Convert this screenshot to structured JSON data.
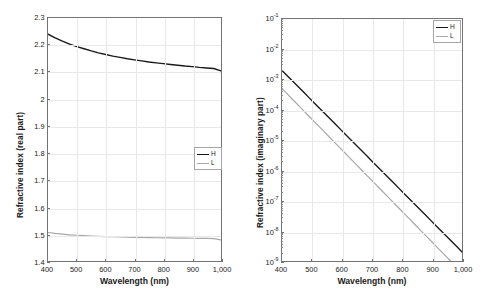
{
  "figure": {
    "panel_count": 2
  },
  "chart_data": [
    {
      "type": "line",
      "panel": "left",
      "title": "",
      "xlabel": "Wavelength (nm)",
      "ylabel": "Refractive index (real part)",
      "xscale": "linear",
      "yscale": "linear",
      "xlim": [
        400,
        1000
      ],
      "ylim": [
        1.4,
        2.3
      ],
      "grid": true,
      "legend_position": "center-right",
      "xticks": [
        400,
        500,
        600,
        700,
        800,
        900,
        1000
      ],
      "xticklabels": [
        "400",
        "500",
        "600",
        "700",
        "800",
        "900",
        "1,000"
      ],
      "yticks": [
        1.4,
        1.5,
        1.6,
        1.7,
        1.8,
        1.9,
        2.0,
        2.1,
        2.2,
        2.3
      ],
      "yticklabels": [
        "1.4",
        "1.5",
        "1.6",
        "1.7",
        "1.8",
        "1.9",
        "2",
        "2.1",
        "2.2",
        "2.3"
      ],
      "x": [
        400,
        425,
        450,
        475,
        500,
        525,
        550,
        575,
        600,
        625,
        650,
        675,
        700,
        725,
        750,
        775,
        800,
        825,
        850,
        875,
        900,
        925,
        950,
        975,
        1000
      ],
      "series": [
        {
          "name": "H",
          "color": "#1a1a1a",
          "width": 1.4,
          "values": [
            2.24,
            2.226,
            2.214,
            2.203,
            2.194,
            2.186,
            2.178,
            2.171,
            2.165,
            2.159,
            2.154,
            2.149,
            2.145,
            2.141,
            2.137,
            2.134,
            2.131,
            2.128,
            2.125,
            2.122,
            2.12,
            2.117,
            2.115,
            2.113,
            2.104
          ]
        },
        {
          "name": "L",
          "color": "#a8a8a8",
          "width": 1.2,
          "values": [
            1.5055,
            1.502,
            1.4993,
            1.4971,
            1.4953,
            1.4938,
            1.4925,
            1.4915,
            1.4905,
            1.4897,
            1.489,
            1.4883,
            1.4877,
            1.4872,
            1.4867,
            1.4862,
            1.4858,
            1.4854,
            1.485,
            1.4846,
            1.4842,
            1.4838,
            1.4835,
            1.4831,
            1.4782
          ]
        }
      ]
    },
    {
      "type": "line",
      "panel": "right",
      "title": "",
      "xlabel": "Wavelength (nm)",
      "ylabel": "Refractive index (imaginary part)",
      "xscale": "linear",
      "yscale": "log",
      "xlim": [
        400,
        1000
      ],
      "ylim": [
        1e-09,
        0.1
      ],
      "grid": true,
      "legend_position": "upper-right",
      "xticks": [
        400,
        500,
        600,
        700,
        800,
        900,
        1000
      ],
      "xticklabels": [
        "400",
        "500",
        "600",
        "700",
        "800",
        "900",
        "1,000"
      ],
      "yticks": [
        1e-09,
        1e-08,
        1e-07,
        1e-06,
        1e-05,
        0.0001,
        0.001,
        0.01,
        0.1
      ],
      "yticklabels": [
        "10-9",
        "10-8",
        "10-7",
        "10-6",
        "10-5",
        "10-4",
        "10-3",
        "10-2",
        "10-1"
      ],
      "yticklabel_base": "10",
      "yticklabel_exponents": [
        "-9",
        "-8",
        "-7",
        "-6",
        "-5",
        "-4",
        "-3",
        "-2",
        "-1"
      ],
      "x": [
        400,
        1000
      ],
      "series": [
        {
          "name": "H",
          "color": "#1a1a1a",
          "width": 1.4,
          "values": [
            0.002,
            2e-09
          ],
          "endpoint_x": [
            400,
            1000
          ]
        },
        {
          "name": "L",
          "color": "#a8a8a8",
          "width": 1.2,
          "values": [
            0.0005,
            1e-09
          ],
          "endpoint_x": [
            400,
            962
          ]
        }
      ]
    }
  ]
}
